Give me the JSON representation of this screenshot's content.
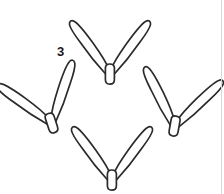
{
  "figure": {
    "kind": "line-art-illustration",
    "number_label": "3",
    "background_color": "#ffffff",
    "stroke_color": "#2b2b2b",
    "fill_color": "#ffffff",
    "rule_color": "#d8d8d8",
    "canvas": {
      "width": 224,
      "height": 194
    },
    "tracks": [
      {
        "id": "track-top",
        "position": "top",
        "center_x": 110,
        "center_y": 40,
        "rotation_deg": 0,
        "scale": 1.0,
        "toe_count": 2,
        "has_heel_pad": true
      },
      {
        "id": "track-left",
        "position": "left",
        "center_x": 48,
        "center_y": 92,
        "rotation_deg": -18,
        "scale": 1.0,
        "toe_count": 2,
        "has_heel_pad": true
      },
      {
        "id": "track-right",
        "position": "right",
        "center_x": 176,
        "center_y": 92,
        "rotation_deg": 10,
        "scale": 1.0,
        "toe_count": 2,
        "has_heel_pad": true
      },
      {
        "id": "track-bottom",
        "position": "bottom",
        "center_x": 112,
        "center_y": 148,
        "rotation_deg": 0,
        "scale": 1.0,
        "toe_count": 2,
        "has_heel_pad": true
      }
    ]
  }
}
